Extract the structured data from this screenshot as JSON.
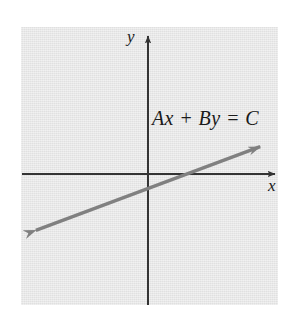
{
  "figure": {
    "title": "",
    "background_color": "#ffffff",
    "panel_color": "#e6e6e6",
    "axis_color": "#333333",
    "line_color": "#808080"
  },
  "labels": {
    "y_axis": "y",
    "x_axis": "x",
    "equation": "Ax + By = C"
  },
  "chart_data": {
    "type": "line",
    "title": "",
    "subtitle": "",
    "xlabel": "x",
    "ylabel": "y",
    "annotations": [
      {
        "text": "Ax + By = C",
        "x": 0.35,
        "y": 0.55,
        "description": "standard form of a linear equation labelling the plotted line"
      }
    ],
    "grid": false,
    "legend": null,
    "axis_arrows": {
      "x_positive": true,
      "y_positive": true
    },
    "xlim": [
      -1,
      1
    ],
    "ylim": [
      -1,
      1
    ],
    "series": [
      {
        "name": "Ax + By = C",
        "style": "solid",
        "color": "#808080",
        "arrows": "both",
        "x": [
          -0.905,
          0.905
        ],
        "y": [
          -0.438,
          0.212
        ],
        "slope": 0.359,
        "x_intercept": 0.29,
        "y_intercept": -0.113
      }
    ]
  }
}
